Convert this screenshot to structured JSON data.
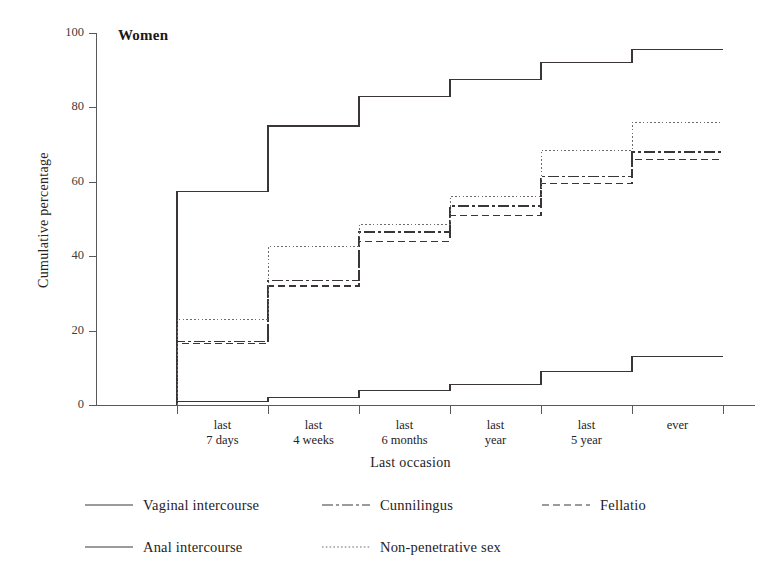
{
  "panel": {
    "title": "Women"
  },
  "axes": {
    "ylabel": "Cumulative percentage",
    "xlabel": "Last occasion",
    "yticks": [
      "0",
      "20",
      "40",
      "60",
      "80",
      "100"
    ]
  },
  "legend": {
    "items": [
      {
        "label": "Vaginal intercourse",
        "style": "solid",
        "key": "vaginal"
      },
      {
        "label": "Cunnilingus",
        "style": "dashdot",
        "key": "cunnilingus"
      },
      {
        "label": "Fellatio",
        "style": "dashed",
        "key": "fellatio"
      },
      {
        "label": "Anal intercourse",
        "style": "solid",
        "key": "anal"
      },
      {
        "label": "Non-penetrative sex",
        "style": "dotted",
        "key": "nonpenetrative"
      }
    ]
  },
  "chart_data": {
    "type": "line",
    "subtype": "step",
    "title": "Women",
    "xlabel": "Last occasion",
    "ylabel": "Cumulative percentage",
    "ylim": [
      0,
      100
    ],
    "yticks": [
      0,
      20,
      40,
      60,
      80,
      100
    ],
    "grid": false,
    "legend_position": "bottom",
    "categories": [
      "last\n7 days",
      "last\n4 weeks",
      "last\n6 months",
      "last\nyear",
      "last\n5 year",
      "ever"
    ],
    "category_lines": [
      [
        "last",
        "7 days"
      ],
      [
        "last",
        "4 weeks"
      ],
      [
        "last",
        "6 months"
      ],
      [
        "last",
        "year"
      ],
      [
        "last",
        "5 year"
      ],
      [
        "ever",
        ""
      ]
    ],
    "series": [
      {
        "name": "Vaginal intercourse",
        "style": "solid",
        "color": "#3a3637",
        "values": [
          57.5,
          75,
          83,
          87.5,
          92,
          95.5
        ]
      },
      {
        "name": "Cunnilingus",
        "style": "dashdot",
        "color": "#3a3637",
        "values": [
          17,
          33.5,
          46.5,
          53.5,
          61.5,
          68
        ]
      },
      {
        "name": "Fellatio",
        "style": "dashed",
        "color": "#3a3637",
        "values": [
          16.5,
          32,
          44,
          51,
          59.5,
          66
        ]
      },
      {
        "name": "Anal intercourse",
        "style": "solid",
        "color": "#3a3637",
        "values": [
          1,
          2,
          4,
          5.5,
          9,
          13
        ]
      },
      {
        "name": "Non-penetrative sex",
        "style": "dotted",
        "color": "#6e6b6c",
        "values": [
          23,
          42.5,
          48.5,
          56,
          68.5,
          76
        ]
      }
    ]
  }
}
